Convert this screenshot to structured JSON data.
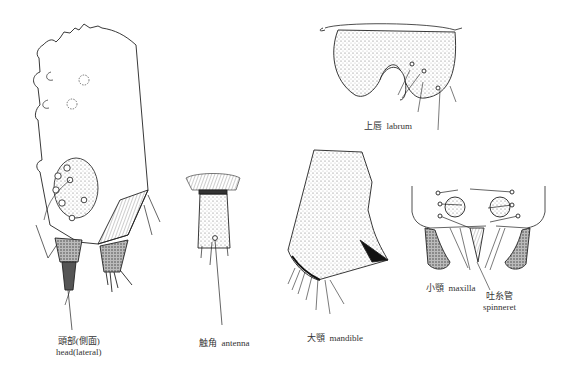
{
  "figure": {
    "panels": [
      {
        "id": "head",
        "label_ja": "頭部(側面)",
        "label_en": "head(lateral)"
      },
      {
        "id": "antenna",
        "label_ja": "触角",
        "label_en": "antenna"
      },
      {
        "id": "mandible",
        "label_ja": "大顎",
        "label_en": "mandible"
      },
      {
        "id": "labrum",
        "label_ja": "上唇",
        "label_en": "labrum"
      },
      {
        "id": "maxilla",
        "label_ja": "小顎",
        "label_en": "maxilla"
      },
      {
        "id": "spinneret",
        "label_ja": "吐糸管",
        "label_en": "spinneret"
      }
    ]
  }
}
